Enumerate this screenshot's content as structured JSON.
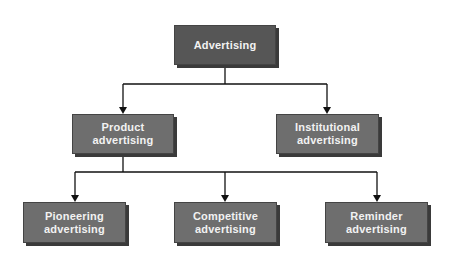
{
  "diagram": {
    "type": "hierarchy",
    "root": {
      "id": "advertising",
      "label": "Advertising"
    },
    "level2": [
      {
        "id": "product",
        "label_line1": "Product",
        "label_line2": "advertising"
      },
      {
        "id": "institutional",
        "label_line1": "Institutional",
        "label_line2": "advertising"
      }
    ],
    "level3": [
      {
        "id": "pioneering",
        "label_line1": "Pioneering",
        "label_line2": "advertising"
      },
      {
        "id": "competitive",
        "label_line1": "Competitive",
        "label_line2": "advertising"
      },
      {
        "id": "reminder",
        "label_line1": "Reminder",
        "label_line2": "advertising"
      }
    ],
    "edges": [
      [
        "advertising",
        "product"
      ],
      [
        "advertising",
        "institutional"
      ],
      [
        "product",
        "pioneering"
      ],
      [
        "product",
        "competitive"
      ],
      [
        "product",
        "reminder"
      ]
    ],
    "colors": {
      "box_root": "#565656",
      "box": "#6e6e6e",
      "text": "#f2f2f2",
      "line": "#111111",
      "shadow": "#3a3a3a"
    }
  }
}
